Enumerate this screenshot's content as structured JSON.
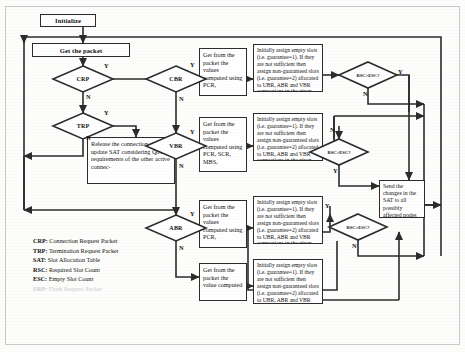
{
  "diagram": {
    "stroke_color": "#2b2b2b",
    "background_color": "#fdfdfc"
  },
  "nodes": {
    "initialize": "Initialize",
    "get_packet": "Get the packet",
    "release": "Release the connection and update SAT considering QoS requirements of the other active connec-",
    "get_cbr": "Get from the packet the values computed using PCR,",
    "get_vbr": "Get from the packet the values computed using PCR, SCR, MBS,",
    "get_abr": "Get from the packet the values computed using PCR,",
    "get_ubr": "Get from the packet the value computed",
    "assign_cbr": "Initially assign empty slots (i.e. guarantee=1). If they are not sufficient then assign non-guaranteed slots (i.e. guarantee=2) allocated to UBR, ABR and VBR connections in the given",
    "assign_vbr": "Initially assign empty slots (i.e. guarantee=1). If they are not sufficient then assign non-guaranteed slots (i.e. guarantee=2) allocated to UBR, ABR and VBR connections in the given",
    "assign_abr": "Initially assign empty slots (i.e. guarantee=1). If they are not sufficient then assign non-guaranteed slots (i.e. guarantee=2) allocated to UBR, ABR and VBR connections in the given",
    "assign_ubr": "Initially assign empty slots (i.e. guarantee=1). If they are not sufficient then assign non-guaranteed slots (i.e. guarantee=2) allocated to UBR, ABR and VBR",
    "send_changes": "Send the changes in the SAT to all possibly affected nodes"
  },
  "decisions": {
    "crp": "CRP",
    "trp": "TRP",
    "cbr": "CBR",
    "vbr": "VBR",
    "abr": "ABR",
    "rsc_esc_1": "RSC>ESC?",
    "rsc_esc_2": "RSC>ESC?",
    "rsc_esc_3": "RSC>ESC?"
  },
  "branch_labels": {
    "crp_yes": "Y",
    "crp_no": "N",
    "trp_yes": "Y",
    "trp_no": "N",
    "cbr_yes": "Y",
    "cbr_no": "N",
    "vbr_yes": "Y",
    "vbr_no": "N",
    "abr_yes": "Y",
    "abr_no": "N",
    "d1_yes": "Y",
    "d1_no": "N",
    "d2_yes": "Y",
    "d2_no": "N",
    "d3_yes": "Y",
    "d3_no": "N"
  },
  "legend": {
    "items": [
      {
        "key": "CRP:",
        "text": "Connection Request Packet"
      },
      {
        "key": "TRP:",
        "text": "Termination Request Packet"
      },
      {
        "key": "SAT:",
        "text": "Slot Allocation Table"
      },
      {
        "key": "RSC:",
        "text": "Required Slot Count"
      },
      {
        "key": "ESC:",
        "text": "Empty Slot Count"
      },
      {
        "key": "FRP:",
        "text": "Flush Request Packet"
      }
    ]
  }
}
